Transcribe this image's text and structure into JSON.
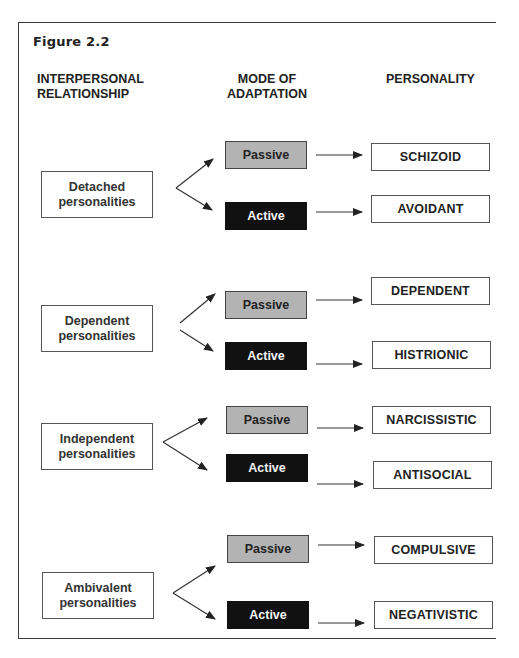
{
  "figure": {
    "title": "Figure  2.2",
    "headers": {
      "relationship_line1": "INTERPERSONAL",
      "relationship_line2": "RELATIONSHIP",
      "mode_line1": "MODE OF",
      "mode_line2": "ADAPTATION",
      "personality": "PERSONALITY"
    },
    "groups": [
      {
        "relationship_line1": "Detached",
        "relationship_line2": "personalities",
        "passive_label": "Passive",
        "active_label": "Active",
        "passive_personality": "SCHIZOID",
        "active_personality": "AVOIDANT"
      },
      {
        "relationship_line1": "Dependent",
        "relationship_line2": "personalities",
        "passive_label": "Passive",
        "active_label": "Active",
        "passive_personality": "DEPENDENT",
        "active_personality": "HISTRIONIC"
      },
      {
        "relationship_line1": "Independent",
        "relationship_line2": "personalities",
        "passive_label": "Passive",
        "active_label": "Active",
        "passive_personality": "NARCISSISTIC",
        "active_personality": "ANTISOCIAL"
      },
      {
        "relationship_line1": "Ambivalent",
        "relationship_line2": "personalities",
        "passive_label": "Passive",
        "active_label": "Active",
        "passive_personality": "COMPULSIVE",
        "active_personality": "NEGATIVISTIC"
      }
    ],
    "colors": {
      "passive_fill": "#b3b3b3",
      "active_fill": "#111111",
      "border": "#555555"
    }
  }
}
